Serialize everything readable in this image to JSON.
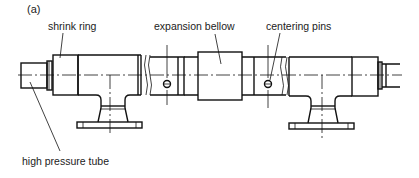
{
  "figure": {
    "panel_label": "(a)",
    "labels": {
      "shrink_ring": "shrink ring",
      "expansion_bellow": "expansion bellow",
      "centering_pins": "centering pins",
      "high_pressure_tube": "high pressure tube"
    },
    "components": [
      "high pressure tube (left)",
      "shrink ring (left)",
      "T-piece with flange (left)",
      "pipe break",
      "centering pin (left)",
      "expansion bellow",
      "centering pin (right)",
      "pipe break",
      "T-piece with flange (right)",
      "shrink ring (right)",
      "high pressure tube (right)"
    ],
    "colors": {
      "line": "#111111",
      "background": "#ffffff",
      "text": "#222222"
    }
  }
}
